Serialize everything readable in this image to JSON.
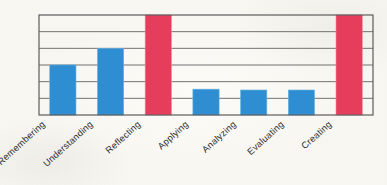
{
  "chart_data": {
    "type": "bar",
    "title": "",
    "subtitle": "",
    "xlabel": "",
    "ylabel": "",
    "categories": [
      "Remembering",
      "Understanding",
      "Reflecting",
      "Applying",
      "Analyzing",
      "Evaluating",
      "Creating"
    ],
    "values": [
      3.0,
      4.0,
      6.0,
      1.55,
      1.5,
      1.5,
      6.0
    ],
    "bar_colors": [
      "#2f8ed2",
      "#2f8ed2",
      "#e63d5d",
      "#2f8ed2",
      "#2f8ed2",
      "#2f8ed2",
      "#e63d5d"
    ],
    "ylim": [
      0,
      6
    ],
    "yticks": [
      0,
      1,
      2,
      3,
      4,
      5,
      6
    ],
    "ytick_labels": [
      "",
      "",
      "",
      "",
      "",
      "",
      ""
    ],
    "grid": true,
    "grid_axis": "y",
    "legend": null,
    "legend_position": "none",
    "annotations": [],
    "axis_color": "#565656",
    "grid_color": "#6a6a6a",
    "background_color": "#fcfbf7",
    "tick_label_rotation": -42
  },
  "figure": {
    "plot_left": 39,
    "plot_right": 373,
    "plot_top": 15,
    "plot_bottom": 115
  }
}
